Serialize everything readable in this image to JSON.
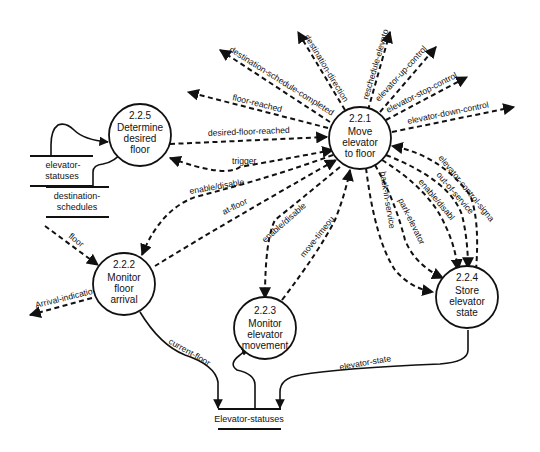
{
  "diagram": {
    "type": "data-flow-diagram",
    "colors": {
      "ink": "#111111",
      "background": "#ffffff"
    },
    "processes": [
      {
        "id": "2.2.1",
        "number": "2.2.1",
        "lines": [
          "Move",
          "elevator",
          "to floor"
        ]
      },
      {
        "id": "2.2.2",
        "number": "2.2.2",
        "lines": [
          "Monitor",
          "floor",
          "arrival"
        ]
      },
      {
        "id": "2.2.3",
        "number": "2.2.3",
        "lines": [
          "Monitor",
          "elevator",
          "movement"
        ]
      },
      {
        "id": "2.2.4",
        "number": "2.2.4",
        "lines": [
          "Store",
          "elevator",
          "state"
        ]
      },
      {
        "id": "2.2.5",
        "number": "2.2.5",
        "lines": [
          "Determine",
          "desired",
          "floor"
        ]
      }
    ],
    "stores": [
      {
        "id": "elevator-statuses",
        "lines": [
          "elevator-",
          "statuses"
        ]
      },
      {
        "id": "destination-schedules",
        "lines": [
          "destination-",
          "schedules"
        ]
      },
      {
        "id": "Elevator-statuses-store",
        "lines": [
          "Elevator-statuses"
        ]
      }
    ],
    "flows": {
      "destination_schedule_completed": "destination-schedule-completed",
      "destination_direction": "destination-direction",
      "reschedule_elevator": "reschedule-elevator",
      "elevator_up_control": "elevator-up-control",
      "elevator_stop_control": "elevator-stop-control",
      "elevator_down_control": "elevator-down-control",
      "floor_reached": "floor-reached",
      "desired_floor_reached": "desired-floor-reached",
      "trigger": "trigger",
      "enable_disable_222": "enable/disable",
      "at_floor": "at-floor",
      "enable_disable_223": "enable/disable",
      "move_timeout": "move-timeout",
      "back_in_service": "back-in-service",
      "park_elevator": "park-elevator",
      "enable_disable_224": "enable/disable",
      "out_of_service": "out-of-service",
      "elevator_control_signals": "elevator-control-signals",
      "floor": "floor",
      "arrival_indication": "Arrival-indication",
      "current_floor": "current-floor",
      "elevator_state": "elevator-state"
    }
  }
}
